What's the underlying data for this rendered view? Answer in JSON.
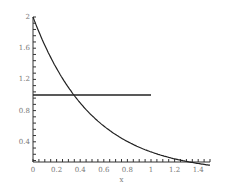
{
  "chart_data": {
    "type": "line",
    "title": "",
    "xlabel": "x",
    "ylabel": "",
    "xlim": [
      0,
      1.5
    ],
    "ylim": [
      0.14,
      2
    ],
    "grid": false,
    "legend": null,
    "x_ticks": [
      "0",
      "0.2",
      "0.4",
      "0.6",
      "0.8",
      "1",
      "1.2",
      "1.4"
    ],
    "y_ticks": [
      "2",
      "1.6",
      "1.2",
      "0.8",
      "0.4"
    ],
    "series": [
      {
        "name": "curve",
        "description": "decaying exponential approx 2*exp(-2x)",
        "x": [
          0,
          0.1,
          0.2,
          0.3,
          0.4,
          0.5,
          0.6,
          0.7,
          0.8,
          0.9,
          1.0,
          1.1,
          1.2,
          1.3,
          1.4,
          1.5
        ],
        "values": [
          2.0,
          1.64,
          1.34,
          1.1,
          0.9,
          0.74,
          0.6,
          0.49,
          0.4,
          0.33,
          0.27,
          0.22,
          0.18,
          0.15,
          0.12,
          0.1
        ]
      },
      {
        "name": "horizontal line",
        "x": [
          0,
          1
        ],
        "values": [
          1,
          1
        ]
      }
    ],
    "colors": {
      "axes": "#333333",
      "lines": "#222222",
      "labels": "#777777"
    }
  }
}
